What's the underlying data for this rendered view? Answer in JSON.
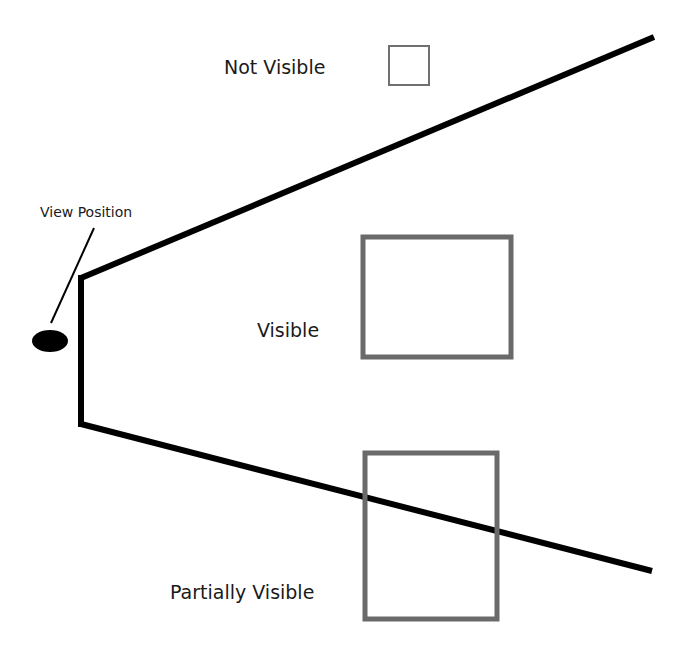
{
  "diagram": {
    "labels": {
      "view_position": "View Position",
      "not_visible": "Not Visible",
      "visible": "Visible",
      "partially_visible": "Partially Visible"
    },
    "colors": {
      "frustum_line": "#000000",
      "box_small_stroke": "#707070",
      "box_stroke": "#6a6a6a",
      "text": "#1a1a1a",
      "background": "#ffffff"
    },
    "elements": {
      "viewer": {
        "shape": "ellipse",
        "cx": 50,
        "cy": 341,
        "rx": 18,
        "ry": 11
      },
      "leader_line": {
        "x1": 51,
        "y1": 322,
        "x2": 94,
        "y2": 228
      },
      "near_plane": {
        "x": 81,
        "y1": 278,
        "y2": 424
      },
      "top_edge": {
        "x1": 81,
        "y1": 278,
        "x2": 654,
        "y2": 37
      },
      "bottom_edge": {
        "x1": 81,
        "y1": 424,
        "x2": 652,
        "y2": 571
      },
      "box_not_visible": {
        "x": 389,
        "y": 46,
        "w": 40,
        "h": 39
      },
      "box_visible": {
        "x": 363,
        "y": 237,
        "w": 148,
        "h": 120
      },
      "box_partially_visible": {
        "x": 365,
        "y": 453,
        "w": 132,
        "h": 166
      }
    }
  }
}
